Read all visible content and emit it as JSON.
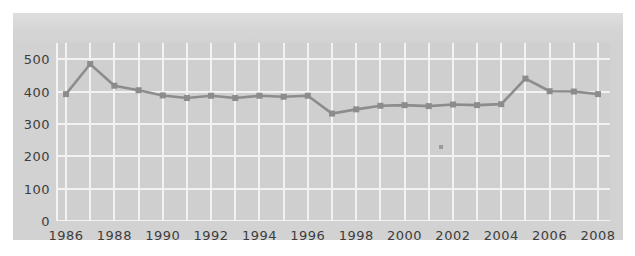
{
  "chart_data": {
    "type": "line",
    "title": "",
    "subtitle": "",
    "xlabel": "",
    "ylabel": "",
    "xlim": [
      1986,
      2008
    ],
    "ylim": [
      0,
      550
    ],
    "grid": true,
    "legend": null,
    "legend_position": "none",
    "marker": "square",
    "series_color": "#8c8c8c",
    "background_color": "#d2d2d2",
    "plot_background_color": "#cfcfcf",
    "gridline_color": "#f2f2f2",
    "text_color": "#3d3d3d",
    "x": [
      1986,
      1987,
      1988,
      1989,
      1990,
      1991,
      1992,
      1993,
      1994,
      1995,
      1996,
      1997,
      1998,
      1999,
      2000,
      2001,
      2002,
      2003,
      2004,
      2005,
      2006,
      2007,
      2008
    ],
    "values": [
      392,
      485,
      418,
      404,
      388,
      380,
      387,
      380,
      387,
      384,
      387,
      332,
      345,
      356,
      358,
      355,
      360,
      358,
      361,
      440,
      401,
      400,
      392
    ],
    "y_ticks": [
      0,
      100,
      200,
      300,
      400,
      500
    ],
    "y_tick_labels": [
      "0",
      "100",
      "200",
      "300",
      "400",
      "500"
    ],
    "x_ticks": [
      1986,
      1988,
      1990,
      1992,
      1994,
      1996,
      1998,
      2000,
      2002,
      2004,
      2006,
      2008
    ],
    "x_tick_labels": [
      "1986",
      "1988",
      "1990",
      "1992",
      "1994",
      "1996",
      "1998",
      "2000",
      "2002",
      "2004",
      "2006",
      "2008"
    ],
    "x_gridlines": [
      1986,
      1987,
      1988,
      1989,
      1990,
      1991,
      1992,
      1993,
      1994,
      1995,
      1996,
      1997,
      1998,
      1999,
      2000,
      2001,
      2002,
      2003,
      2004,
      2005,
      2006,
      2007,
      2008
    ],
    "annotations": [
      {
        "name": "stray-dot",
        "x": 2001.5,
        "y": 228
      }
    ]
  }
}
